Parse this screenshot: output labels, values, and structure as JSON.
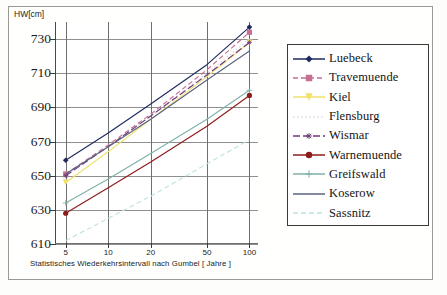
{
  "figure": {
    "y_axis_title": "HW[cm]",
    "x_axis_title": "Statistisches Wiederkehrsintervall nach Gumbel  [ Jahre ]"
  },
  "axes": {
    "y_ticks": [
      "730",
      "710",
      "690",
      "670",
      "650",
      "630",
      "610"
    ],
    "x_ticks": [
      "5",
      "10",
      "20",
      "50",
      "100"
    ]
  },
  "legend": {
    "items": [
      {
        "label": "Luebeck",
        "color": "#1f2a5e",
        "dash": "none",
        "marker": "diamond"
      },
      {
        "label": "Travemuende",
        "color": "#c76f93",
        "dash": "dash",
        "marker": "square"
      },
      {
        "label": "Kiel",
        "color": "#f2e06a",
        "dash": "none",
        "marker": "triangle"
      },
      {
        "label": "Flensburg",
        "color": "#dcd6e8",
        "dash": "dot",
        "marker": "none"
      },
      {
        "label": "Wismar",
        "color": "#6b3a7a",
        "dash": "dashlong",
        "marker": "asterisk"
      },
      {
        "label": "Warnemuende",
        "color": "#8e1b1b",
        "dash": "none",
        "marker": "circle"
      },
      {
        "label": "Greifswald",
        "color": "#7fb2a8",
        "dash": "none",
        "marker": "plus"
      },
      {
        "label": "Koserow",
        "color": "#5a6480",
        "dash": "none",
        "marker": "none"
      },
      {
        "label": "Sassnitz",
        "color": "#bfe2e2",
        "dash": "dash",
        "marker": "none"
      }
    ]
  },
  "chart_data": {
    "type": "line",
    "title": "",
    "xlabel": "Statistisches Wiederkehrsintervall nach Gumbel  [ Jahre ]",
    "ylabel": "HW[cm]",
    "xscale": "log",
    "x": [
      5,
      10,
      20,
      50,
      100
    ],
    "xlim": [
      4.2,
      115
    ],
    "ylim": [
      610,
      740
    ],
    "grid": true,
    "legend_position": "right",
    "series": [
      {
        "name": "Luebeck",
        "color": "#1f2a5e",
        "dash": "none",
        "marker": "diamond",
        "values": [
          659,
          675,
          692,
          715,
          737
        ]
      },
      {
        "name": "Travemuende",
        "color": "#c76f93",
        "dash": "dash",
        "marker": "square",
        "values": [
          651,
          668,
          686,
          712,
          734
        ]
      },
      {
        "name": "Kiel",
        "color": "#f2e06a",
        "dash": "none",
        "marker": "triangle",
        "values": [
          646,
          664,
          683,
          708,
          728
        ]
      },
      {
        "name": "Flensburg",
        "color": "#dcd6e8",
        "dash": "dot",
        "marker": "none",
        "values": [
          650,
          667,
          685,
          710,
          730
        ]
      },
      {
        "name": "Wismar",
        "color": "#6b3a7a",
        "dash": "dashlong",
        "marker": "asterisk",
        "values": [
          650,
          667,
          685,
          709,
          728
        ]
      },
      {
        "name": "Warnemuende",
        "color": "#8e1b1b",
        "dash": "none",
        "marker": "circle",
        "values": [
          628,
          643,
          658,
          679,
          697
        ]
      },
      {
        "name": "Greifswald",
        "color": "#7fb2a8",
        "dash": "none",
        "marker": "plus",
        "values": [
          634,
          648,
          663,
          683,
          700
        ]
      },
      {
        "name": "Koserow",
        "color": "#5a6480",
        "dash": "none",
        "marker": "none",
        "values": [
          651,
          667,
          683,
          706,
          723
        ]
      },
      {
        "name": "Sassnitz",
        "color": "#bfe2e2",
        "dash": "dash",
        "marker": "none",
        "values": [
          612,
          625,
          638,
          657,
          671
        ]
      }
    ]
  }
}
